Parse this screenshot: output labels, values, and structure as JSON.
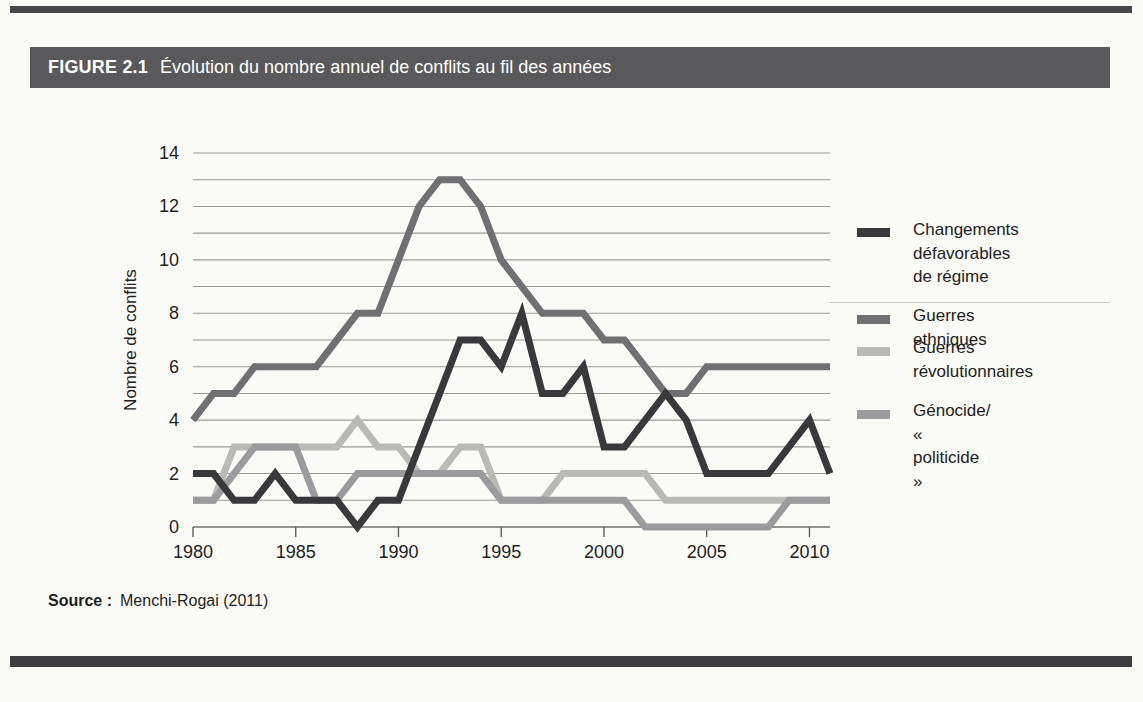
{
  "page": {
    "figure_label": "FIGURE 2.1",
    "figure_title": "Évolution du nombre annuel de conflits au fil des années",
    "source_label": "Source :",
    "source_text": "Menchi-Rogai (2011)"
  },
  "chart_data": {
    "type": "line",
    "title": "Évolution du nombre annuel de conflits au fil des années",
    "xlabel": "",
    "ylabel": "Nombre de conflits",
    "x_range": [
      1980,
      2011
    ],
    "ylim": [
      0,
      14
    ],
    "y_ticks": [
      0,
      2,
      4,
      6,
      8,
      10,
      12,
      14
    ],
    "grid_step": 1,
    "x_ticks": [
      1980,
      1985,
      1990,
      1995,
      2000,
      2005,
      2010
    ],
    "grid": "horizontal-only",
    "legend_position": "right",
    "years": [
      1980,
      1981,
      1982,
      1983,
      1984,
      1985,
      1986,
      1987,
      1988,
      1989,
      1990,
      1991,
      1992,
      1993,
      1994,
      1995,
      1996,
      1997,
      1998,
      1999,
      2000,
      2001,
      2002,
      2003,
      2004,
      2005,
      2006,
      2007,
      2008,
      2009,
      2010,
      2011
    ],
    "series": [
      {
        "name": "Changements défavorables de régime",
        "legend_label": "Changements\ndéfavorables\nde régime",
        "color": "#39393c",
        "stroke_width": 7,
        "values": [
          2,
          2,
          1,
          1,
          2,
          1,
          1,
          1,
          0,
          1,
          1,
          3,
          5,
          7,
          7,
          6,
          8,
          5,
          5,
          6,
          3,
          3,
          4,
          5,
          4,
          2,
          2,
          2,
          2,
          3,
          4,
          2
        ]
      },
      {
        "name": "Guerres ethniques",
        "legend_label": "Guerres ethniques",
        "color": "#707073",
        "stroke_width": 7,
        "values": [
          4,
          5,
          5,
          6,
          6,
          6,
          6,
          7,
          8,
          8,
          10,
          12,
          13,
          13,
          12,
          10,
          9,
          8,
          8,
          8,
          7,
          7,
          6,
          5,
          5,
          6,
          6,
          6,
          6,
          6,
          6,
          6
        ]
      },
      {
        "name": "Guerres révolutionnaires",
        "legend_label": "Guerres\nrévolutionnaires",
        "color": "#b9b9b6",
        "stroke_width": 7,
        "values": [
          1,
          1,
          3,
          3,
          3,
          3,
          3,
          3,
          4,
          3,
          3,
          2,
          2,
          3,
          3,
          1,
          1,
          1,
          2,
          2,
          2,
          2,
          2,
          1,
          1,
          1,
          1,
          1,
          1,
          1,
          1,
          1
        ]
      },
      {
        "name": "Génocide/« politicide »",
        "legend_label": "Génocide/\n« politicide »",
        "color": "#9b9b9d",
        "stroke_width": 7,
        "values": [
          1,
          1,
          2,
          3,
          3,
          3,
          1,
          1,
          2,
          2,
          2,
          2,
          2,
          2,
          2,
          1,
          1,
          1,
          1,
          1,
          1,
          1,
          0,
          0,
          0,
          0,
          0,
          0,
          0,
          1,
          1,
          1
        ]
      }
    ]
  }
}
